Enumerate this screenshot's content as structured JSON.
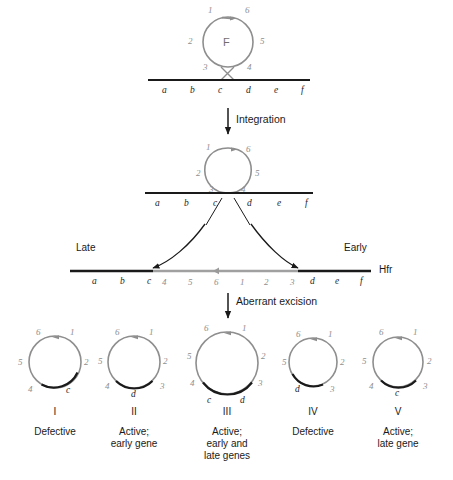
{
  "figure": {
    "colors": {
      "f_factor_gray": "#8e8e8e",
      "chromosome_black": "#1a1a1a",
      "text": "#1a1a1a"
    },
    "steps": [
      {
        "id": "integration",
        "label": "Integration"
      },
      {
        "id": "aberrant-excision",
        "label": "Aberrant excision"
      }
    ],
    "orientation": {
      "late": "Late",
      "early": "Early",
      "hfr": "Hfr"
    },
    "f_circle": {
      "center_label": "F",
      "segments": [
        "1",
        "6",
        "5",
        "4",
        "3",
        "2"
      ]
    },
    "top_chromosome": {
      "genes": [
        "a",
        "b",
        "c",
        "d",
        "e",
        "f"
      ]
    },
    "integrated_chromosome": {
      "genes": [
        "a",
        "b",
        "c",
        "d",
        "e",
        "f"
      ],
      "loop_segments": [
        "1",
        "6",
        "5",
        "4",
        "3",
        "2"
      ]
    },
    "hfr_chromosome": {
      "left_genes": [
        "a",
        "b",
        "c"
      ],
      "f_segments": [
        "4",
        "5",
        "6",
        "1",
        "2",
        "3"
      ],
      "right_genes": [
        "d",
        "e",
        "f"
      ]
    },
    "products": [
      {
        "roman": "I",
        "caption": "Defective",
        "numbers": [
          "6",
          "1",
          "2",
          "4",
          "5"
        ],
        "genes": [
          "c"
        ]
      },
      {
        "roman": "II",
        "caption": "Active;\nearly gene",
        "numbers": [
          "6",
          "1",
          "2",
          "3",
          "4",
          "5"
        ],
        "genes": [
          "d"
        ]
      },
      {
        "roman": "III",
        "caption": "Active;\nearly and\nlate genes",
        "numbers": [
          "6",
          "1",
          "2",
          "3",
          "4",
          "5"
        ],
        "genes": [
          "c",
          "d"
        ]
      },
      {
        "roman": "IV",
        "caption": "Defective",
        "numbers": [
          "6",
          "1",
          "2",
          "3",
          "5"
        ],
        "genes": [
          "d"
        ]
      },
      {
        "roman": "V",
        "caption": "Active;\nlate gene",
        "numbers": [
          "6",
          "1",
          "2",
          "3",
          "4",
          "5"
        ],
        "genes": [
          "c"
        ]
      }
    ]
  }
}
